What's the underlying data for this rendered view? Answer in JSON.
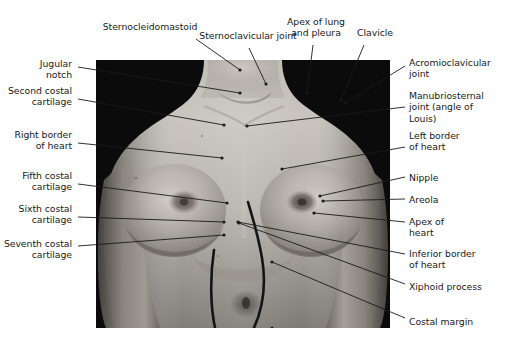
{
  "figure": {
    "width": 506,
    "height": 351,
    "background_color": "#ffffff"
  },
  "photo": {
    "name": "anterior-thorax-photograph",
    "description": "Black and white photograph of a female anterior chest and upper abdomen with the cardiac outline drawn on the skin",
    "frame": {
      "x": 96,
      "y": 60,
      "width": 294,
      "height": 268
    },
    "background_color": "#0a0a0a",
    "skin_tone_light": "#c8c4bd",
    "skin_tone_mid": "#a29d96",
    "skin_tone_dark": "#6e6a64",
    "overlay_line_color": "#141414"
  },
  "style": {
    "text_color": "#1a1a1a",
    "leader_color": "#1a1a1a",
    "leader_width": 0.9,
    "dot_radius": 1.6,
    "font_size_px": 9.3
  },
  "labels": [
    {
      "id": "sternocleidomastoid",
      "text": "Sternocleidomastoid",
      "align": "center-align",
      "x": 90,
      "y": 21,
      "w": 120,
      "leader": {
        "from": [
          196,
          39
        ],
        "to": [
          240,
          70
        ]
      },
      "dot": [
        240,
        70
      ]
    },
    {
      "id": "sternoclavicular-joint",
      "text": "Sternoclavicular joint",
      "align": "center-align",
      "x": 188,
      "y": 30,
      "w": 120,
      "leader": {
        "from": [
          249,
          48
        ],
        "to": [
          266,
          84
        ]
      },
      "dot": [
        266,
        84
      ]
    },
    {
      "id": "apex-of-lung-and-pleura",
      "text": "Apex of lung\nand pleura",
      "align": "center-align",
      "x": 280,
      "y": 16,
      "w": 72,
      "leader": {
        "from": [
          313,
          45
        ],
        "to": [
          307,
          93
        ]
      },
      "dot": [
        307,
        93
      ]
    },
    {
      "id": "clavicle",
      "text": "Clavicle",
      "align": "center-align",
      "x": 350,
      "y": 27,
      "w": 50,
      "leader": {
        "from": [
          364,
          45
        ],
        "to": [
          341,
          100
        ]
      },
      "dot": [
        341,
        100
      ]
    },
    {
      "id": "jugular-notch",
      "text": "Jugular\nnotch",
      "align": "right-align",
      "x": 2,
      "y": 58,
      "w": 70,
      "leader": {
        "from": [
          78,
          67
        ],
        "to": [
          240,
          93
        ]
      },
      "dot": [
        240,
        93
      ]
    },
    {
      "id": "second-costal-cartilage",
      "text": "Second costal\ncartilage",
      "align": "right-align",
      "x": 2,
      "y": 85,
      "w": 70,
      "leader": {
        "from": [
          78,
          99
        ],
        "to": [
          224,
          125
        ]
      },
      "dot": [
        224,
        125
      ]
    },
    {
      "id": "right-border-of-heart",
      "text": "Right border\nof heart",
      "align": "right-align",
      "x": 2,
      "y": 129,
      "w": 70,
      "leader": {
        "from": [
          78,
          143
        ],
        "to": [
          222,
          158
        ]
      },
      "dot": [
        222,
        158
      ]
    },
    {
      "id": "fifth-costal-cartilage",
      "text": "Fifth costal\ncartilage",
      "align": "right-align",
      "x": 2,
      "y": 170,
      "w": 70,
      "leader": {
        "from": [
          78,
          184
        ],
        "to": [
          227,
          203
        ]
      },
      "dot": [
        227,
        203
      ]
    },
    {
      "id": "sixth-costal-cartilage",
      "text": "Sixth costal\ncartilage",
      "align": "right-align",
      "x": 2,
      "y": 203,
      "w": 70,
      "leader": {
        "from": [
          78,
          217
        ],
        "to": [
          224,
          222
        ]
      },
      "dot": [
        224,
        222
      ]
    },
    {
      "id": "seventh-costal-cartilage",
      "text": "Seventh costal\ncartilage",
      "align": "right-align",
      "x": 2,
      "y": 238,
      "w": 70,
      "leader": {
        "from": [
          78,
          246
        ],
        "to": [
          224,
          235
        ]
      },
      "dot": [
        224,
        235
      ]
    },
    {
      "id": "acromioclavicular-joint",
      "text": "Acromioclavicular\njoint",
      "align": "left-align",
      "x": 409,
      "y": 57,
      "w": 96,
      "leader": {
        "from": [
          405,
          66
        ],
        "to": [
          345,
          103
        ]
      },
      "dot": [
        345,
        103
      ]
    },
    {
      "id": "manubriosternal-joint",
      "text": "Manubriosternal\njoint (angle of\nLouis)",
      "align": "left-align",
      "x": 409,
      "y": 90,
      "w": 96,
      "leader": {
        "from": [
          405,
          107
        ],
        "to": [
          247,
          126
        ]
      },
      "dot": [
        247,
        126
      ]
    },
    {
      "id": "left-border-of-heart",
      "text": "Left border\nof heart",
      "align": "left-align",
      "x": 409,
      "y": 130,
      "w": 96,
      "leader": {
        "from": [
          405,
          147
        ],
        "to": [
          282,
          169
        ]
      },
      "dot": [
        282,
        169
      ]
    },
    {
      "id": "nipple",
      "text": "Nipple",
      "align": "left-align",
      "x": 409,
      "y": 172,
      "w": 96,
      "leader": {
        "from": [
          405,
          177
        ],
        "to": [
          320,
          196
        ]
      },
      "dot": [
        320,
        196
      ]
    },
    {
      "id": "areola",
      "text": "Areola",
      "align": "left-align",
      "x": 409,
      "y": 194,
      "w": 96,
      "leader": {
        "from": [
          405,
          199
        ],
        "to": [
          323,
          201
        ]
      },
      "dot": [
        323,
        201
      ]
    },
    {
      "id": "apex-of-heart",
      "text": "Apex of\nheart",
      "align": "left-align",
      "x": 409,
      "y": 216,
      "w": 96,
      "leader": {
        "from": [
          405,
          222
        ],
        "to": [
          314,
          213
        ]
      },
      "dot": [
        314,
        213
      ]
    },
    {
      "id": "inferior-border-of-heart",
      "text": "Inferior border\nof heart",
      "align": "left-align",
      "x": 409,
      "y": 248,
      "w": 96,
      "leader": {
        "from": [
          405,
          254
        ],
        "to": [
          238,
          222
        ]
      },
      "dot": [
        238,
        222
      ]
    },
    {
      "id": "xiphoid-process",
      "text": "Xiphoid process",
      "align": "left-align",
      "x": 409,
      "y": 281,
      "w": 96,
      "leader": {
        "from": [
          405,
          284
        ],
        "to": [
          239,
          223
        ]
      },
      "dot": [
        239,
        223
      ]
    },
    {
      "id": "costal-margin",
      "text": "Costal margin",
      "align": "left-align",
      "x": 409,
      "y": 316,
      "w": 96,
      "leader": {
        "from": [
          405,
          318
        ],
        "to": [
          272,
          262
        ]
      },
      "dot": [
        272,
        262
      ]
    }
  ]
}
